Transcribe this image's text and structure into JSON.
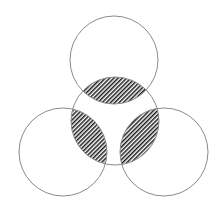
{
  "diagram": {
    "type": "overlapping-circles",
    "canvas": {
      "width": 224,
      "height": 209,
      "background": "#ffffff"
    },
    "colors": {
      "outline": "#8a8a8a",
      "hatch": "#1a1a1a",
      "hatch_background": "#ffffff"
    },
    "hatch": {
      "period": 3,
      "angle": 45,
      "stroke_width": 1.5
    },
    "center_circle": {
      "id": "center",
      "cx": 115,
      "cy": 121,
      "r": 44
    },
    "outer_circles": [
      {
        "id": "top",
        "cx": 114,
        "cy": 60,
        "r": 44
      },
      {
        "id": "left",
        "cx": 63,
        "cy": 152,
        "r": 44
      },
      {
        "id": "right",
        "cx": 164,
        "cy": 152,
        "r": 44
      }
    ],
    "hatched_regions": [
      {
        "id": "lens-top",
        "between": [
          "center",
          "top"
        ]
      },
      {
        "id": "lens-left",
        "between": [
          "center",
          "left"
        ]
      },
      {
        "id": "lens-right",
        "between": [
          "center",
          "right"
        ]
      }
    ]
  }
}
